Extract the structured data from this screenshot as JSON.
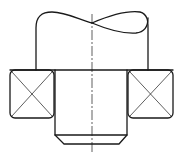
{
  "drawing": {
    "title": "Shaft with rolling bearings (section view)",
    "type": "technical-mechanical-drawing",
    "colors": {
      "line": "#1a1a1a",
      "background": "#ffffff"
    },
    "elements": {
      "upper_shaft": {
        "x1": 36,
        "x2": 148,
        "top_y": 14,
        "bottom_y": 70,
        "break_line": "S-curve"
      },
      "shoulder_line": {
        "x1": 10,
        "x2": 173,
        "y": 70
      },
      "left_bearing": {
        "x": 10,
        "y": 70,
        "w": 44,
        "h": 48,
        "symbol": "cross"
      },
      "right_bearing": {
        "x": 128,
        "y": 70,
        "w": 45,
        "h": 48,
        "symbol": "cross"
      },
      "lower_shaft": {
        "x1": 55,
        "x2": 127,
        "top_y": 70,
        "bottom_y": 135,
        "chamfer_y": 144,
        "chamfer_x1": 64,
        "chamfer_x2": 119
      },
      "centerline": {
        "x": 92,
        "y1": 14,
        "y2": 152,
        "style": "dash-dot"
      }
    }
  }
}
